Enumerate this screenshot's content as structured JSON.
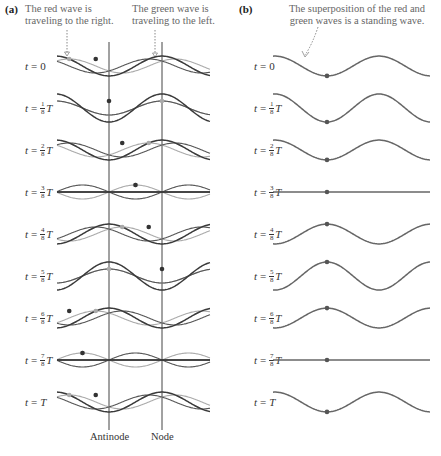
{
  "panel_a": {
    "label": "(a)",
    "caption_red": [
      "The red wave is",
      "traveling to the right."
    ],
    "caption_green": [
      "The green wave is",
      "traveling to the left."
    ],
    "antinode_label": "Antinode",
    "node_label": "Node"
  },
  "panel_b": {
    "label": "(b)",
    "caption": [
      "The superposition of the red and",
      "green waves is a standing wave."
    ]
  },
  "rows": [
    {
      "var": "t",
      "eq": "=",
      "value": "0",
      "num": "",
      "den": "",
      "T": ""
    },
    {
      "var": "t",
      "eq": "=",
      "value": "",
      "num": "1",
      "den": "8",
      "T": "T"
    },
    {
      "var": "t",
      "eq": "=",
      "value": "",
      "num": "2",
      "den": "8",
      "T": "T"
    },
    {
      "var": "t",
      "eq": "=",
      "value": "",
      "num": "3",
      "den": "8",
      "T": "T"
    },
    {
      "var": "t",
      "eq": "=",
      "value": "",
      "num": "4",
      "den": "8",
      "T": "T"
    },
    {
      "var": "t",
      "eq": "=",
      "value": "",
      "num": "5",
      "den": "8",
      "T": "T"
    },
    {
      "var": "t",
      "eq": "=",
      "value": "",
      "num": "6",
      "den": "8",
      "T": "T"
    },
    {
      "var": "t",
      "eq": "=",
      "value": "",
      "num": "7",
      "den": "8",
      "T": "T"
    },
    {
      "var": "t",
      "eq": "=",
      "value": "",
      "num": "",
      "den": "",
      "T": "T"
    }
  ],
  "colors": {
    "red_wave": "#555555",
    "green_wave": "#aaaaaa",
    "sum_wave": "#3a3a3a",
    "standing_wave": "#666666",
    "marker_lines": "#444444",
    "caption_text": "#666666"
  }
}
